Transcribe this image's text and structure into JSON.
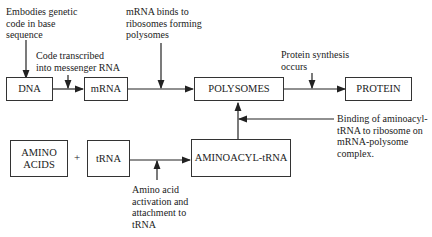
{
  "diagram": {
    "type": "flowchart",
    "nodes": [
      {
        "id": "dna",
        "label": "DNA"
      },
      {
        "id": "mrna",
        "label": "mRNA"
      },
      {
        "id": "polysomes",
        "label": "POLYSOMES"
      },
      {
        "id": "protein",
        "label": "PROTEIN"
      },
      {
        "id": "amino_acids",
        "label": "AMINO\nACIDS"
      },
      {
        "id": "trna",
        "label": "tRNA"
      },
      {
        "id": "aminoacyl_trna",
        "label": "AMINOACYL-tRNA"
      }
    ],
    "operator": "+",
    "annotations": {
      "dna_note": "Embodies genetic\ncode in base\nsequence",
      "transcription_note": "Code transcribed\ninto messenger RNA",
      "mrna_note": "mRNA binds to\nribosomes forming\npolysomes",
      "synthesis_note": "Protein synthesis\noccurs",
      "binding_note": "Binding of aminoacyl-\ntRNA to ribosome on\nmRNA-polysome\ncomplex.",
      "activation_note": "Amino acid\nactivation and\nattachment to\ntRNA"
    },
    "edges": [
      {
        "from": "dna",
        "to": "mrna"
      },
      {
        "from": "mrna",
        "to": "polysomes"
      },
      {
        "from": "polysomes",
        "to": "protein"
      },
      {
        "from": "trna",
        "to": "aminoacyl_trna"
      },
      {
        "from": "aminoacyl_trna",
        "to": "polysomes"
      }
    ]
  }
}
